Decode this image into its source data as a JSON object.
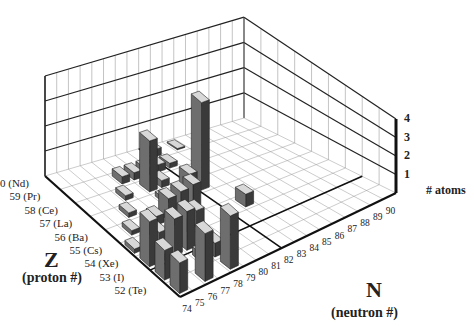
{
  "chart_data": {
    "type": "bar3d",
    "title": "",
    "xlabel": "N",
    "xlabel_sub": "(neutron #)",
    "ylabel": "Z",
    "ylabel_sub": "(proton #)",
    "zlabel": "# atoms",
    "x_ticks": [
      "74",
      "75",
      "76",
      "77",
      "78",
      "79",
      "80",
      "81",
      "82",
      "83",
      "84",
      "85",
      "86",
      "87",
      "88",
      "89",
      "90"
    ],
    "y_ticks": [
      "52 (Te)",
      "53 (I)",
      "54 (Xe)",
      "55 (Cs)",
      "56 (Ba)",
      "57 (La)",
      "58 (Ce)",
      "59 (Pr)",
      "60 (Nd)"
    ],
    "z_ticks": [
      "1",
      "2",
      "3",
      "4"
    ],
    "zlim": [
      0,
      4
    ],
    "grid": true,
    "bars": [
      {
        "N": 74,
        "Z": 52,
        "value": 1.6
      },
      {
        "N": 74,
        "Z": 53,
        "value": 1.5
      },
      {
        "N": 74,
        "Z": 54,
        "value": 2.2
      },
      {
        "N": 74,
        "Z": 55,
        "value": 0.2
      },
      {
        "N": 75,
        "Z": 54,
        "value": 0.3
      },
      {
        "N": 75,
        "Z": 56,
        "value": 0.2
      },
      {
        "N": 76,
        "Z": 52,
        "value": 2.5
      },
      {
        "N": 76,
        "Z": 54,
        "value": 1.8
      },
      {
        "N": 76,
        "Z": 55,
        "value": 0.5
      },
      {
        "N": 76,
        "Z": 57,
        "value": 0.2
      },
      {
        "N": 77,
        "Z": 53,
        "value": 0.4
      },
      {
        "N": 77,
        "Z": 54,
        "value": 1.9
      },
      {
        "N": 77,
        "Z": 56,
        "value": 0.4
      },
      {
        "N": 77,
        "Z": 58,
        "value": 0.2
      },
      {
        "N": 78,
        "Z": 52,
        "value": 2.8
      },
      {
        "N": 78,
        "Z": 53,
        "value": 0.7
      },
      {
        "N": 78,
        "Z": 55,
        "value": 0.6
      },
      {
        "N": 78,
        "Z": 56,
        "value": 1.0
      },
      {
        "N": 78,
        "Z": 59,
        "value": 0.3
      },
      {
        "N": 79,
        "Z": 55,
        "value": 0.8
      },
      {
        "N": 79,
        "Z": 56,
        "value": 1.1
      },
      {
        "N": 79,
        "Z": 57,
        "value": 0.2
      },
      {
        "N": 79,
        "Z": 58,
        "value": 2.2
      },
      {
        "N": 79,
        "Z": 59,
        "value": 0.3
      },
      {
        "N": 80,
        "Z": 56,
        "value": 1.2
      },
      {
        "N": 80,
        "Z": 58,
        "value": 0.3
      },
      {
        "N": 80,
        "Z": 59,
        "value": 0.3
      },
      {
        "N": 81,
        "Z": 57,
        "value": 0.9
      },
      {
        "N": 81,
        "Z": 59,
        "value": 0.3
      },
      {
        "N": 82,
        "Z": 57,
        "value": 3.9
      },
      {
        "N": 82,
        "Z": 59,
        "value": 0.2
      },
      {
        "N": 82,
        "Z": 60,
        "value": 0.3
      },
      {
        "N": 83,
        "Z": 55,
        "value": 0.6
      },
      {
        "N": 84,
        "Z": 60,
        "value": 0.05
      }
    ],
    "highlight_lines": [
      {
        "axis": "N",
        "at": 82
      },
      {
        "axis": "Z",
        "at": 54
      }
    ]
  }
}
